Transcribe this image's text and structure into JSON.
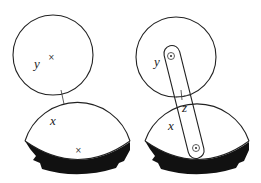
{
  "figures": [
    {
      "name": "left-figure",
      "description": "Circle y resting on circular segment x, with contact point marked",
      "labels": {
        "top_body": "y",
        "bottom_body": "x"
      },
      "marks": {
        "top_center": "×",
        "bottom_center": "×"
      }
    },
    {
      "name": "right-figure",
      "description": "Circle y and segment x connected by a rod through pins; contact point z",
      "labels": {
        "top_body": "y",
        "bottom_body": "x",
        "contact": "z"
      }
    }
  ],
  "colors": {
    "line": "#222222",
    "ground": "#111111",
    "background": "#ffffff"
  }
}
